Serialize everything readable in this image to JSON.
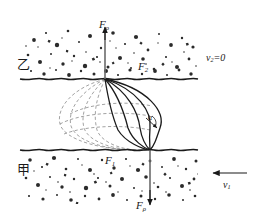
{
  "figure": {
    "width": 261,
    "height": 220,
    "background": "#ffffff",
    "ink": "#1a1a1a",
    "dashed_color": "#8a8a8a",
    "grain_color": "#2b2b2b"
  },
  "labels": {
    "force_top": {
      "base": "F",
      "sub": "ρ"
    },
    "force_bottom": {
      "base": "F",
      "sub": "ρ"
    },
    "force_upper_interface": {
      "base": "F",
      "sub": "2"
    },
    "force_lower_interface": {
      "base": "F",
      "sub": "1"
    },
    "medium_upper": "乙",
    "medium_lower": "甲",
    "velocity_upper": {
      "base": "v",
      "sub": "2",
      "value": "=0"
    },
    "velocity_lower": {
      "base": "v",
      "sub": "1"
    },
    "angle": "α"
  },
  "geometry": {
    "axis_x": 105,
    "axis_top_y": 26,
    "interface_upper_y": 79,
    "interface_lower_y": 150,
    "axis_bottom_y": 206,
    "lens_apex_top": {
      "x": 105,
      "y": 79
    },
    "lens_apex_bottom": {
      "x": 150,
      "y": 150
    },
    "arrow_v1": {
      "x1": 247,
      "y1": 173,
      "x2": 212,
      "y2": 173
    }
  },
  "elements": {
    "solid_curves": 4,
    "dashed_curves": 4,
    "interface_style": "wavy",
    "grain_regions": [
      "upper",
      "lower"
    ]
  }
}
